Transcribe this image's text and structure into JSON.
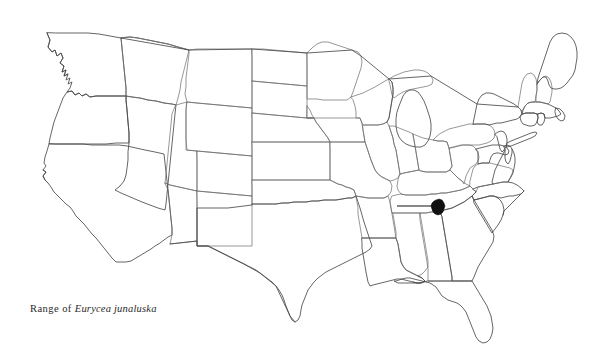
{
  "figure": {
    "type": "distribution-range-map",
    "region": "Contiguous United States",
    "background_color": "#ffffff",
    "width": 607,
    "height": 361
  },
  "caption": {
    "full_text": "Range of Eurycea junaluska",
    "prefix": "Range of",
    "species_name": "Eurycea junaluska",
    "genus": "Eurycea",
    "epithet": "junaluska",
    "style": "italic-species-name",
    "color": "#2a2a2a"
  },
  "map": {
    "outline_color": "#6b6b6b",
    "coast_color": "#4a4a4a",
    "fill_color": "none",
    "state_count": 48,
    "states": [
      "Washington",
      "Oregon",
      "California",
      "Nevada",
      "Idaho",
      "Montana",
      "Wyoming",
      "Utah",
      "Arizona",
      "Colorado",
      "New Mexico",
      "North Dakota",
      "South Dakota",
      "Nebraska",
      "Kansas",
      "Oklahoma",
      "Texas",
      "Minnesota",
      "Iowa",
      "Missouri",
      "Arkansas",
      "Louisiana",
      "Wisconsin",
      "Illinois",
      "Michigan",
      "Indiana",
      "Ohio",
      "Kentucky",
      "Tennessee",
      "Mississippi",
      "Alabama",
      "Georgia",
      "Florida",
      "South Carolina",
      "North Carolina",
      "Virginia",
      "West Virginia",
      "Maryland",
      "Delaware",
      "Pennsylvania",
      "New Jersey",
      "New York",
      "Connecticut",
      "Rhode Island",
      "Massachusetts",
      "Vermont",
      "New Hampshire",
      "Maine"
    ]
  },
  "range_marker": {
    "label": "range-blob",
    "color": "#111111",
    "shape": "irregular-filled-polygon",
    "location_description": "Appalachian Mountains, Tennessee / North Carolina border",
    "center_x": 438,
    "center_y": 207,
    "approx_width": 11,
    "approx_height": 13
  },
  "pointer": {
    "label": "arrow",
    "color": "#111111",
    "direction": "right",
    "start_x": 397,
    "end_x": 435,
    "y": 206
  }
}
